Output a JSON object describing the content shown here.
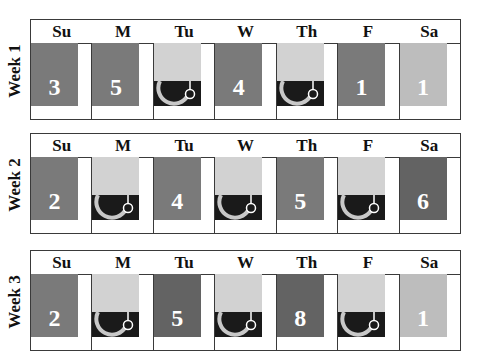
{
  "days": [
    "Su",
    "M",
    "Tu",
    "W",
    "Th",
    "F",
    "Sa"
  ],
  "weeks": [
    {
      "label": "Week 1",
      "cells": [
        {
          "type": "number",
          "value": "3",
          "shade": "medium"
        },
        {
          "type": "number",
          "value": "5",
          "shade": "medium"
        },
        {
          "type": "icon",
          "icon": "hook-with-ring-icon"
        },
        {
          "type": "number",
          "value": "4",
          "shade": "medium"
        },
        {
          "type": "icon",
          "icon": "hook-with-ring-icon"
        },
        {
          "type": "number",
          "value": "1",
          "shade": "medium"
        },
        {
          "type": "number",
          "value": "1",
          "shade": "light"
        }
      ]
    },
    {
      "label": "Week 2",
      "cells": [
        {
          "type": "number",
          "value": "2",
          "shade": "medium"
        },
        {
          "type": "icon",
          "icon": "hook-with-ring-icon"
        },
        {
          "type": "number",
          "value": "4",
          "shade": "medium"
        },
        {
          "type": "icon",
          "icon": "hook-with-ring-icon"
        },
        {
          "type": "number",
          "value": "5",
          "shade": "medium"
        },
        {
          "type": "icon",
          "icon": "hook-with-ring-icon"
        },
        {
          "type": "number",
          "value": "6",
          "shade": "dark"
        }
      ]
    },
    {
      "label": "Week 3",
      "cells": [
        {
          "type": "number",
          "value": "2",
          "shade": "medium"
        },
        {
          "type": "icon",
          "icon": "hook-with-ring-icon"
        },
        {
          "type": "number",
          "value": "5",
          "shade": "dark"
        },
        {
          "type": "icon",
          "icon": "hook-with-ring-icon"
        },
        {
          "type": "number",
          "value": "8",
          "shade": "dark"
        },
        {
          "type": "icon",
          "icon": "hook-with-ring-icon"
        },
        {
          "type": "number",
          "value": "1",
          "shade": "light"
        }
      ]
    }
  ],
  "colors": {
    "medium": "#7a7a7a",
    "dark": "#636363",
    "light": "#bdbdbd",
    "icon_top": "#d2d2d2",
    "icon_bottom": "#1a1a1a",
    "border": "#3a3a3a"
  }
}
